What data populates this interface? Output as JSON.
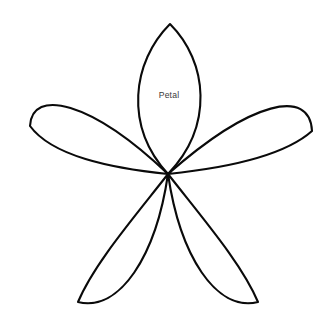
{
  "figure": {
    "title_fragment": "",
    "background_color": "#ffffff",
    "stroke_color": "#0a0a0a",
    "stroke_width": 2.1,
    "label_color": "#3a3a3a",
    "canvas": {
      "width": 324,
      "height": 322
    },
    "center": {
      "x": 168,
      "y": 174
    },
    "annotation": {
      "text": "Petal",
      "x": 169,
      "y": 96
    },
    "petals": [
      {
        "name": "top-petal",
        "label": "Petal",
        "tip": {
          "x": 170,
          "y": 24
        },
        "angle_deg": -90,
        "path": "M 168 174 C 124 126, 132 62, 170 24 C 208 62, 214 126, 168 174 Z"
      },
      {
        "name": "right-petal",
        "label": "",
        "tip": {
          "x": 312,
          "y": 131
        },
        "angle_deg": -18,
        "path": "M 168 174 C 226 168, 284 156, 312 131 C 310 88, 252 100, 168 174 Z"
      },
      {
        "name": "bottom-right-petal",
        "label": "",
        "tip": {
          "x": 258,
          "y": 302
        },
        "angle_deg": 54,
        "path": "M 168 174 C 204 220, 242 264, 258 302 C 216 312, 180 256, 168 174 Z"
      },
      {
        "name": "bottom-left-petal",
        "label": "",
        "tip": {
          "x": 78,
          "y": 302
        },
        "angle_deg": 126,
        "path": "M 168 174 C 132 220, 94 264, 78 302 C 120 312, 156 256, 168 174 Z"
      },
      {
        "name": "left-petal",
        "label": "",
        "tip": {
          "x": 30,
          "y": 126
        },
        "angle_deg": 198,
        "path": "M 168 174 C 110 168, 52 156, 30 126 C 32 88, 90 100, 168 174 Z"
      }
    ]
  }
}
